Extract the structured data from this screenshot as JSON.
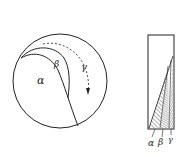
{
  "figure": {
    "left_panel": {
      "type": "circle-section",
      "region_labels": {
        "alpha": "α",
        "beta": "β",
        "gamma": "γ"
      },
      "arrow": "dashed-curved-arrow"
    },
    "right_panel": {
      "type": "hatched-wedge-column",
      "region_labels": {
        "alpha": "α",
        "beta": "β",
        "gamma": "γ"
      }
    },
    "colors": {
      "stroke": "#222222",
      "background": "#ffffff"
    }
  }
}
